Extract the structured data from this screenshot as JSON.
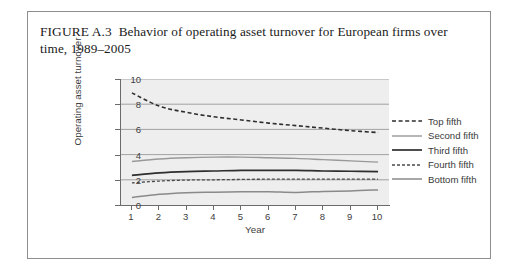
{
  "figure": {
    "label": "FIGURE A.3",
    "caption": "Behavior of operating asset turnover for European firms over time, 1989–2005"
  },
  "chart_data": {
    "type": "line",
    "title": "Behavior of operating asset turnover for European firms over time, 1989–2005",
    "xlabel": "Year",
    "ylabel": "Operating asset turnover",
    "xlim": [
      0.6,
      10.4
    ],
    "ylim": [
      0,
      10
    ],
    "xticks": [
      1,
      2,
      3,
      4,
      5,
      6,
      7,
      8,
      9,
      10
    ],
    "yticks": [
      0,
      2,
      4,
      6,
      8,
      10
    ],
    "grid": "horizontal",
    "legend_position": "right",
    "x": [
      1,
      2,
      3,
      4,
      5,
      6,
      7,
      8,
      9,
      10
    ],
    "series": [
      {
        "name": "Top fifth",
        "style": "dashed",
        "width": 1.6,
        "color": "#2e2e2e",
        "values": [
          8.9,
          7.85,
          7.35,
          7.0,
          6.75,
          6.5,
          6.3,
          6.1,
          5.9,
          5.75
        ]
      },
      {
        "name": "Second fifth",
        "style": "solid",
        "width": 1.4,
        "color": "#999999",
        "values": [
          3.45,
          3.65,
          3.75,
          3.8,
          3.8,
          3.75,
          3.7,
          3.6,
          3.5,
          3.4
        ]
      },
      {
        "name": "Third fifth",
        "style": "solid",
        "width": 1.7,
        "color": "#2e2e2e",
        "values": [
          2.35,
          2.55,
          2.65,
          2.7,
          2.75,
          2.75,
          2.75,
          2.7,
          2.68,
          2.65
        ]
      },
      {
        "name": "Fourth fifth",
        "style": "dashed",
        "width": 1.3,
        "color": "#4a4a4a",
        "values": [
          1.75,
          1.9,
          1.98,
          2.0,
          2.03,
          2.05,
          2.05,
          2.05,
          2.05,
          2.05
        ]
      },
      {
        "name": "Bottom fifth",
        "style": "solid",
        "width": 1.5,
        "color": "#8a8a8a",
        "values": [
          0.6,
          0.85,
          0.98,
          1.02,
          1.05,
          1.05,
          1.0,
          1.08,
          1.12,
          1.2
        ]
      }
    ]
  },
  "axes": {
    "y_ticks": [
      "0",
      "2",
      "4",
      "6",
      "8",
      "10"
    ],
    "x_ticks": [
      "1",
      "2",
      "3",
      "4",
      "5",
      "6",
      "7",
      "8",
      "9",
      "10"
    ],
    "y_title": "Operating asset turnover",
    "x_title": "Year"
  },
  "legend": {
    "entries": [
      {
        "label": "Top fifth"
      },
      {
        "label": "Second fifth"
      },
      {
        "label": "Third fifth"
      },
      {
        "label": "Fourth fifth"
      },
      {
        "label": "Bottom fifth"
      }
    ]
  },
  "colors": {
    "plot_background": "#eeeeee",
    "gridline": "#8e8e8e",
    "frame": "#8e8e8e",
    "text": "#3d3d3d"
  }
}
